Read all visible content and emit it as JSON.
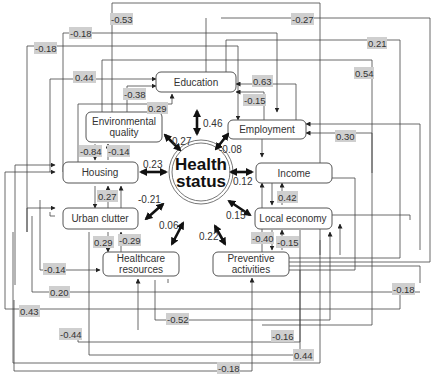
{
  "diagram": {
    "center": {
      "label_line1": "Health",
      "label_line2": "status"
    },
    "nodes": {
      "education": "Education",
      "environmental_1": "Environmental",
      "environmental_2": "quality",
      "employment": "Employment",
      "housing": "Housing",
      "income": "Income",
      "urban_clutter": "Urban clutter",
      "local_economy": "Local economy",
      "healthcare_1": "Healthcare",
      "healthcare_2": "resources",
      "preventive_1": "Preventive",
      "preventive_2": "activities"
    },
    "direct_effects": {
      "education": "0.46",
      "environmental_quality": "0.27",
      "employment": "-0.08",
      "housing": "0.23",
      "income": "0.12",
      "urban_clutter": "-0.21",
      "local_economy": "0.15",
      "healthcare_resources": "0.06",
      "preventive_activities": "0.22"
    },
    "path_coefficients": {
      "c_053": "-0.53",
      "c_018a": "-0.18",
      "c_018b": "-0.18",
      "c_027": "-0.27",
      "c_021": "0.21",
      "c_054": "0.54",
      "c_044": "0.44",
      "c_063": "0.63",
      "c_038": "-0.38",
      "c_015a": "-0.15",
      "c_029a": "0.29",
      "c_030": "0.30",
      "c_084": "-0.84",
      "c_014a": "-0.14",
      "c_027b": "0.27",
      "c_042": "0.42",
      "c_029b": "0.29",
      "c_029c": "-0.29",
      "c_040": "-0.40",
      "c_015b": "-0.15",
      "c_014b": "-0.14",
      "c_018c": "-0.18",
      "c_020": "0.20",
      "c_043": "0.43",
      "c_052": "-0.52",
      "c_016": "-0.16",
      "c_044b": "-0.44",
      "c_044c": "0.44",
      "c_018d": "-0.18"
    }
  }
}
